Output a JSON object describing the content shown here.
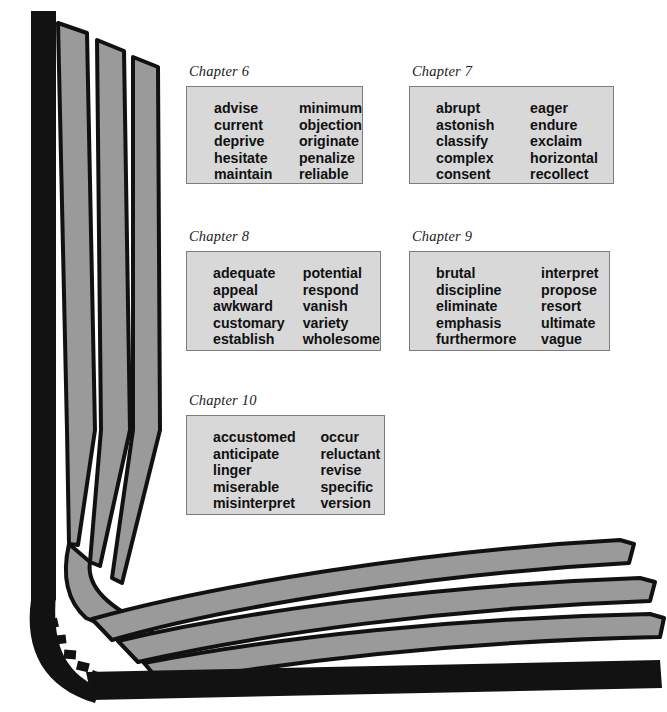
{
  "page": {
    "background_color": "#ffffff"
  },
  "illustration": {
    "name": "open-book",
    "cover_color": "#121212",
    "page_fill_color": "#9a9a9a",
    "page_outline_color": "#111111",
    "description": "Open book with pages fanning upward along the spine and rightward along the bottom cover"
  },
  "styles": {
    "box_background": "#d8d8d8",
    "box_border": "#7d7d7d",
    "text_color": "#111111"
  },
  "chapters": [
    {
      "id": "ch6",
      "label": "Chapter 6",
      "left_column": [
        "advise",
        "current",
        "deprive",
        "hesitate",
        "maintain"
      ],
      "right_column": [
        "minimum",
        "objection",
        "originate",
        "penalize",
        "reliable"
      ]
    },
    {
      "id": "ch7",
      "label": "Chapter 7",
      "left_column": [
        "abrupt",
        "astonish",
        "classify",
        "complex",
        "consent"
      ],
      "right_column": [
        "eager",
        "endure",
        "exclaim",
        "horizontal",
        "recollect"
      ]
    },
    {
      "id": "ch8",
      "label": "Chapter 8",
      "left_column": [
        "adequate",
        "appeal",
        "awkward",
        "customary",
        "establish"
      ],
      "right_column": [
        "potential",
        "respond",
        "vanish",
        "variety",
        "wholesome"
      ]
    },
    {
      "id": "ch9",
      "label": "Chapter 9",
      "left_column": [
        "brutal",
        "discipline",
        "eliminate",
        "emphasis",
        "furthermore"
      ],
      "right_column": [
        "interpret",
        "propose",
        "resort",
        "ultimate",
        "vague"
      ]
    },
    {
      "id": "ch10",
      "label": "Chapter 10",
      "left_column": [
        "accustomed",
        "anticipate",
        "linger",
        "miserable",
        "misinterpret"
      ],
      "right_column": [
        "occur",
        "reluctant",
        "revise",
        "specific",
        "version"
      ]
    }
  ]
}
